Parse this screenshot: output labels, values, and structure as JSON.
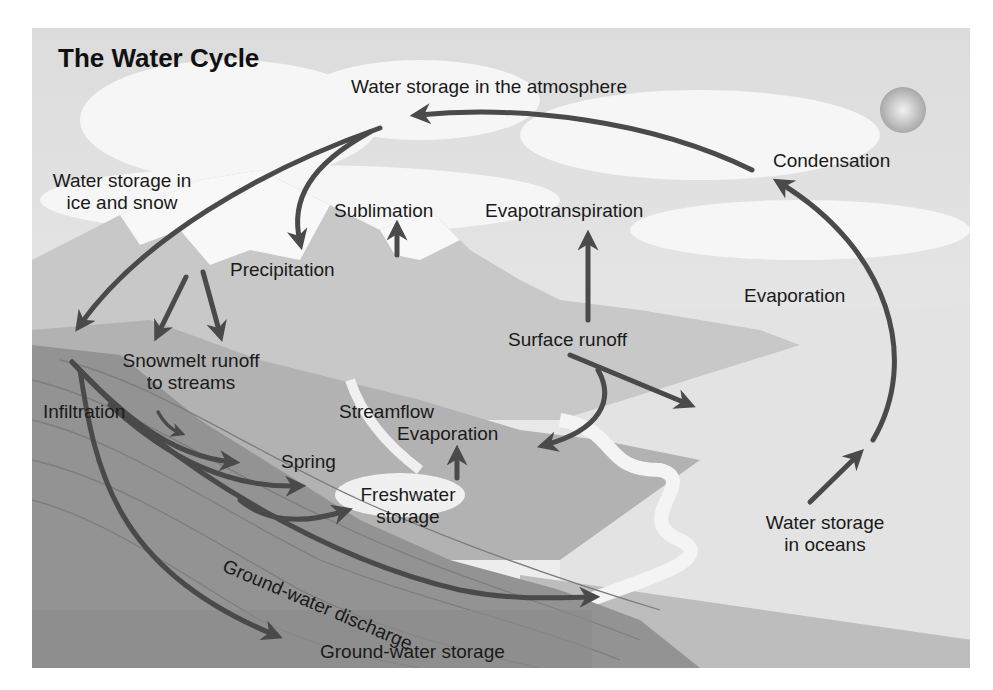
{
  "title": "The Water Cycle",
  "labels": {
    "atmosphere": "Water storage in the atmosphere",
    "condensation": "Condensation",
    "ice_snow_line1": "Water storage in",
    "ice_snow_line2": "ice and snow",
    "sublimation": "Sublimation",
    "evapotranspiration": "Evapotranspiration",
    "precipitation": "Precipitation",
    "evaporation_ocean": "Evaporation",
    "surface_runoff": "Surface runoff",
    "snowmelt_line1": "Snowmelt runoff",
    "snowmelt_line2": "to streams",
    "infiltration": "Infiltration",
    "streamflow": "Streamflow",
    "evaporation_fresh": "Evaporation",
    "spring": "Spring",
    "freshwater_line1": "Freshwater",
    "freshwater_line2": "storage",
    "gw_discharge": "Ground-water discharge",
    "ocean_line1": "Water storage",
    "ocean_line2": "in oceans",
    "gw_storage": "Ground-water storage"
  },
  "colors": {
    "arrow": "#4a4a4a",
    "sky": "#e6e6e6",
    "cloud": "#f4f4f4",
    "ocean": "#dedede",
    "land_light": "#c9c9c9",
    "land_mid": "#a9a9a9",
    "ground": "#8f8f8f",
    "snow": "#f7f7f7",
    "sun": "#bdbdbd"
  }
}
